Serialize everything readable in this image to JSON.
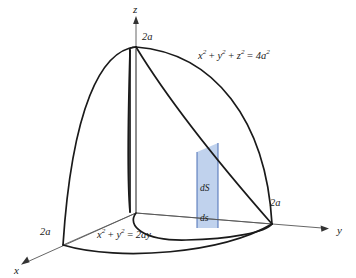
{
  "figure": {
    "title_semantic": "viviani-curve-solid-diagram",
    "background_color": "#ffffff",
    "stroke_color": "#1a1a1a",
    "thin_stroke_color": "#555555",
    "strip_fill_color": "#bdd0ec",
    "strip_border_color": "#4a6fb5"
  },
  "axes": {
    "x": {
      "label": "x",
      "tick_label": "2a"
    },
    "y": {
      "label": "y",
      "tick_label": "2a"
    },
    "z": {
      "label": "z",
      "tick_label": "2a"
    }
  },
  "equations": {
    "sphere": {
      "full": "x² + y² + z² = 4a²",
      "t1": "x",
      "t1sup": "2",
      "plus1": "+",
      "t2": "y",
      "t2sup": "2",
      "plus2": "+",
      "t3": "z",
      "t3sup": "2",
      "eq": "=",
      "rhs": "4a",
      "rhssup": "2"
    },
    "cylinder": {
      "full": "x² + y² = 2ay",
      "t1": "x",
      "t1sup": "2",
      "plus1": "+",
      "t2": "y",
      "t2sup": "2",
      "eq": "=",
      "rhs": "2ay"
    }
  },
  "strip": {
    "surface_element_label": "dS",
    "arc_element_label": "ds"
  }
}
